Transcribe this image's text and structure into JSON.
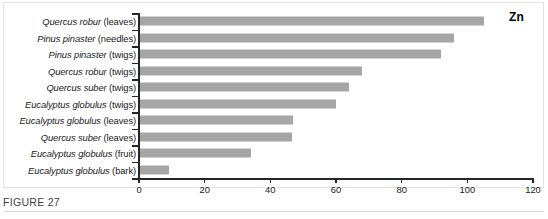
{
  "figure": {
    "caption": "FIGURE 27",
    "element_symbol": "Zn"
  },
  "colors": {
    "bar": "#a6a6a6",
    "axis": "#262626",
    "frame": "#e3e3e3",
    "text": "#1a1a1a",
    "caption_text": "#3f3f3f",
    "caption_rule": "#d8d8d8"
  },
  "chart_data": {
    "type": "bar",
    "orientation": "horizontal",
    "title": "",
    "subtitle": "",
    "annotations": [
      "Zn"
    ],
    "xlabel": "",
    "ylabel": "",
    "xlim": [
      0,
      120
    ],
    "xticks": [
      0,
      20,
      40,
      60,
      80,
      100,
      120
    ],
    "xtick_labels": [
      "0",
      "20",
      "40",
      "60",
      "80",
      "100",
      "120"
    ],
    "grid": false,
    "legend": null,
    "categories": [
      "Quercus robur (leaves)",
      "Pinus pinaster (needles)",
      "Pinus pinaster (twigs)",
      "Quercus robur (twigs)",
      "Quercus suber (twigs)",
      "Eucalyptus globulus (twigs)",
      "Eucalyptus globulus (leaves)",
      "Quercus suber (leaves)",
      "Eucalyptus globulus (fruit)",
      "Eucalyptus globulus (bark)"
    ],
    "category_parts": [
      {
        "species": "Quercus robur",
        "part": "(leaves)"
      },
      {
        "species": "Pinus pinaster",
        "part": "(needles)"
      },
      {
        "species": "Pinus pinaster",
        "part": "(twigs)"
      },
      {
        "species": "Quercus robur",
        "part": "(twigs)"
      },
      {
        "species": "Quercus suber",
        "part": "(twigs)"
      },
      {
        "species": "Eucalyptus globulus",
        "part": "(twigs)"
      },
      {
        "species": "Eucalyptus globulus",
        "part": "(leaves)"
      },
      {
        "species": "Quercus suber",
        "part": "(leaves)"
      },
      {
        "species": "Eucalyptus globulus",
        "part": "(fruit)"
      },
      {
        "species": "Eucalyptus globulus",
        "part": "(bark)"
      }
    ],
    "values": [
      105,
      96,
      92,
      68,
      64,
      60,
      47,
      46.5,
      34,
      9
    ]
  }
}
